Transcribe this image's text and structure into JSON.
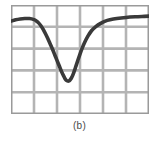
{
  "figure": {
    "caption": "(b)",
    "panel_label": "b"
  },
  "style": {
    "grid_color": "#b4b4b4",
    "border_color": "#9a9a9a",
    "curve_color": "#3a3a3a",
    "background_color": "#ffffff",
    "caption_color": "#4a4a4a",
    "curve_width": "1.3",
    "grid_width": "0.9"
  },
  "chart_data": {
    "type": "line",
    "title": "",
    "subtitle": "",
    "xlabel": "",
    "ylabel": "",
    "caption": "(b)",
    "grid": true,
    "grid_columns": 6,
    "grid_rows": 5,
    "legend": null,
    "legend_position": "none",
    "axis_tick_labels": {
      "x": [],
      "y": []
    },
    "xlim": [
      0,
      6
    ],
    "ylim": [
      0,
      5
    ],
    "series": [
      {
        "name": "curve",
        "x": [
          0.0,
          0.2,
          0.4,
          0.6,
          0.8,
          1.0,
          1.1,
          1.2,
          1.3,
          1.4,
          1.5,
          1.6,
          1.7,
          1.8,
          1.9,
          2.0,
          2.1,
          2.2,
          2.3,
          2.35,
          2.4,
          2.45,
          2.5,
          2.55,
          2.62,
          2.7,
          2.8,
          2.9,
          3.0,
          3.1,
          3.2,
          3.35,
          3.5,
          3.7,
          3.9,
          4.1,
          4.3,
          4.6,
          5.0,
          5.4,
          5.8,
          6.0
        ],
        "y": [
          4.26,
          4.32,
          4.36,
          4.38,
          4.38,
          4.33,
          4.27,
          4.18,
          4.05,
          3.88,
          3.68,
          3.46,
          3.22,
          2.98,
          2.72,
          2.46,
          2.2,
          1.94,
          1.72,
          1.62,
          1.55,
          1.52,
          1.51,
          1.54,
          1.64,
          1.82,
          2.12,
          2.44,
          2.75,
          3.03,
          3.28,
          3.58,
          3.82,
          4.02,
          4.16,
          4.26,
          4.32,
          4.38,
          4.43,
          4.46,
          4.48,
          4.49
        ]
      }
    ]
  }
}
